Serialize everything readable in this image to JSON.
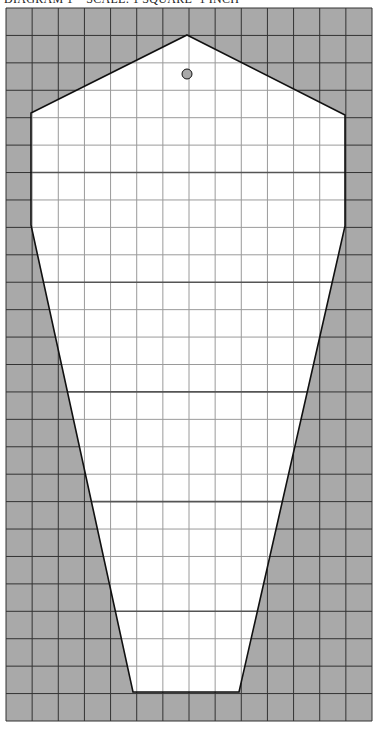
{
  "header": {
    "title": "DIAGRAM 1    SCALE: 1 SQUARE=1 INCH"
  },
  "diagram": {
    "grid": {
      "columns": 14,
      "rows": 26,
      "x0": 6,
      "y0": 8,
      "x1": 372,
      "y1": 721
    },
    "shape_vertices": [
      [
        187,
        35
      ],
      [
        345,
        115
      ],
      [
        345,
        226
      ],
      [
        239,
        692
      ],
      [
        133,
        692
      ],
      [
        31,
        225
      ],
      [
        31,
        113
      ]
    ],
    "hole": {
      "cx": 187,
      "cy": 74,
      "r": 5
    },
    "accent_lines_rows": [
      6,
      10,
      14,
      18,
      22
    ],
    "colors": {
      "background_fill": "#a9a9a9",
      "shape_fill": "#ffffff",
      "grid_line": "#333333",
      "inner_grid_line": "#9a9a9a",
      "outline": "#111111"
    }
  }
}
